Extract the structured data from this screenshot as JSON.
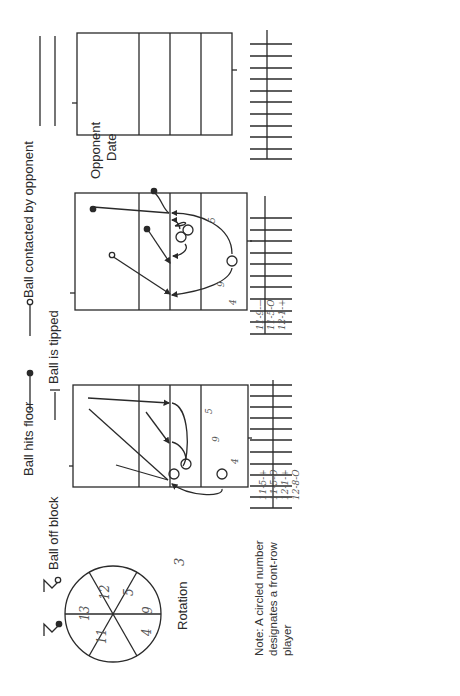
{
  "legend": {
    "ball_hits_floor": "Ball hits floor",
    "ball_contacted_by_opponent": "Ball contacted by opponent",
    "ball_off_block": "Ball off block",
    "ball_is_tipped": "Ball is tipped"
  },
  "header": {
    "opponent_label": "Opponent",
    "date_label": "Date",
    "opponent_value": "",
    "date_value": ""
  },
  "rotation": {
    "label": "Rotation",
    "value": "3",
    "wheel_positions": [
      "12",
      "5",
      "9",
      "4",
      "11",
      "13"
    ]
  },
  "note": "Note: A circled number designates a front-row player",
  "courts": [
    {
      "id": "court-1",
      "back_row_numbers": [
        "5",
        "9",
        "4"
      ],
      "front_row_circled": [
        "12",
        "13",
        "11"
      ],
      "attack_log": [
        "11-5-+",
        "11-5-O",
        "12-1-+",
        "12-8-O"
      ]
    },
    {
      "id": "court-2",
      "back_row_numbers": [
        "5",
        "9",
        "4"
      ],
      "front_row_circled": [
        "12",
        "13",
        "11"
      ],
      "attack_log": [
        "11-9-—",
        "11-5-O",
        "12-1-+"
      ]
    },
    {
      "id": "court-3",
      "back_row_numbers": [],
      "front_row_circled": [],
      "attack_log": []
    }
  ],
  "colors": {
    "ink": "#2a2a2a",
    "paper": "#ffffff"
  }
}
